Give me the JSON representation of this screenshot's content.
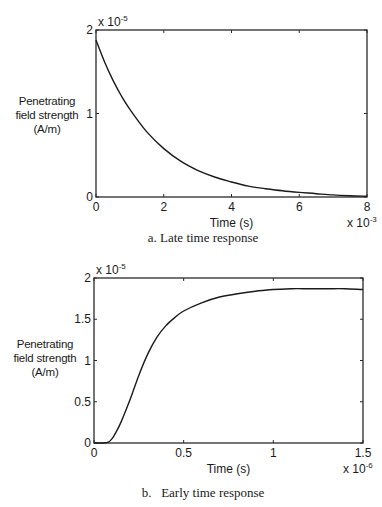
{
  "chart_data": [
    {
      "type": "line",
      "title": "a. Late time response",
      "xlabel": "Time (s)",
      "ylabel": "Penetrating field strength (A/m)",
      "x_multiplier": "x 10^-3",
      "y_multiplier": "x 10^-5",
      "xlim": [
        0,
        8
      ],
      "ylim": [
        0,
        2
      ],
      "xticks": [
        "0",
        "2",
        "4",
        "6",
        "8"
      ],
      "yticks": [
        "0",
        "1",
        "2"
      ],
      "grid": false,
      "legend": null,
      "series": [
        {
          "name": "late-time",
          "x": [
            0,
            0.25,
            0.5,
            0.75,
            1.0,
            1.5,
            2.0,
            2.5,
            3.0,
            3.5,
            4.0,
            4.5,
            5.0,
            5.5,
            6.0,
            6.5,
            7.0,
            7.5,
            8.0
          ],
          "y": [
            1.88,
            1.62,
            1.4,
            1.21,
            1.05,
            0.78,
            0.58,
            0.43,
            0.32,
            0.24,
            0.18,
            0.13,
            0.1,
            0.075,
            0.055,
            0.04,
            0.025,
            0.015,
            0.01
          ]
        }
      ]
    },
    {
      "type": "line",
      "title": "b. Early time response",
      "xlabel": "Time (s)",
      "ylabel": "Penetrating field strength (A/m)",
      "x_multiplier": "x 10^-6",
      "y_multiplier": "x 10^-5",
      "xlim": [
        0,
        1.5
      ],
      "ylim": [
        0,
        2
      ],
      "xticks": [
        "0",
        "0.5",
        "1",
        "1.5"
      ],
      "yticks": [
        "0",
        "0.5",
        "1",
        "1.5",
        "2"
      ],
      "grid": false,
      "legend": null,
      "series": [
        {
          "name": "early-time",
          "x": [
            0,
            0.05,
            0.08,
            0.1,
            0.12,
            0.15,
            0.2,
            0.25,
            0.3,
            0.35,
            0.4,
            0.45,
            0.5,
            0.6,
            0.7,
            0.8,
            0.9,
            1.0,
            1.1,
            1.2,
            1.3,
            1.4,
            1.5
          ],
          "y": [
            0,
            0,
            0.01,
            0.05,
            0.12,
            0.25,
            0.52,
            0.82,
            1.08,
            1.28,
            1.42,
            1.52,
            1.6,
            1.7,
            1.77,
            1.81,
            1.84,
            1.86,
            1.87,
            1.87,
            1.87,
            1.87,
            1.86
          ]
        }
      ]
    }
  ],
  "figure_a": {
    "y_exponent_base": "x 10",
    "y_exponent_power": "-5",
    "x_exponent_base": "x 10",
    "x_exponent_power": "-3",
    "ylabel_lines": [
      "Penetrating",
      "field strength",
      "(A/m)"
    ],
    "xlabel": "Time (s)",
    "caption": "a. Late time response"
  },
  "figure_b": {
    "y_exponent_base": "x 10",
    "y_exponent_power": "-5",
    "x_exponent_base": "x 10",
    "x_exponent_power": "-6",
    "ylabel_lines": [
      "Penetrating",
      "field strength",
      "(A/m)"
    ],
    "xlabel": "Time (s)",
    "caption": "b.   Early time response"
  },
  "colors": {
    "line": "#1a1a1a",
    "axes": "#2a2a2a",
    "background": "#ffffff"
  }
}
